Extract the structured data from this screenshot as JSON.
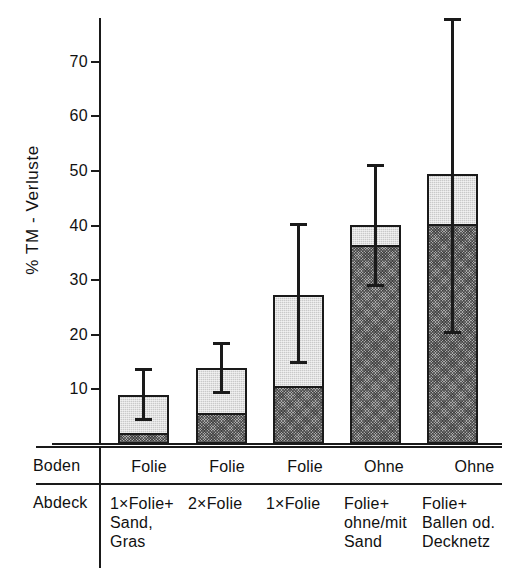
{
  "chart_data": {
    "type": "bar",
    "title": "",
    "xlabel": "",
    "ylabel": "% TM - Verluste",
    "ylim": [
      0,
      78
    ],
    "grid": false,
    "legend": "none",
    "ytick_labels": [
      "70",
      "60",
      "50",
      "40",
      "30",
      "20",
      "10"
    ],
    "ytick_values": [
      70,
      60,
      50,
      40,
      30,
      20,
      10
    ],
    "categories": [
      "Folie / 1×Folie+ Sand, Gras",
      "Folie / 2×Folie",
      "Folie / 1×Folie",
      "Ohne / Folie+ ohne/mit Sand",
      "Ohne / Folie+ Ballen od. Decknetz"
    ],
    "series": [
      {
        "name": "untere Schicht (dunkel schraffiert)",
        "values": [
          2.0,
          5.7,
          10.7,
          36.5,
          40.2
        ]
      },
      {
        "name": "obere Schicht (hell)",
        "values": [
          7.0,
          8.3,
          16.6,
          3.6,
          9.3
        ]
      }
    ],
    "totals": [
      9.0,
      14.0,
      27.3,
      40.1,
      49.5
    ],
    "error_bars": [
      {
        "low": 4.3,
        "high": 14.0
      },
      {
        "low": 9.1,
        "high": 18.7
      },
      {
        "low": 14.6,
        "high": 40.4
      },
      {
        "low": 28.7,
        "high": 51.2
      },
      {
        "low": 20.2,
        "high": 78.0
      }
    ],
    "colors": {
      "upper_segment": "#c9c9c9",
      "lower_segment": "#a8a8a8",
      "outline": "#1a1a1a",
      "error_bar": "#1a1a1a",
      "background": "#ffffff"
    }
  },
  "table": {
    "row_headers": [
      "Boden",
      "Abdeck"
    ],
    "boden": [
      "Folie",
      "Folie",
      "Folie",
      "Ohne",
      "Ohne"
    ],
    "abdeck": [
      "1×Folie+\nSand, Gras",
      "2×Folie",
      "1×Folie",
      "Folie+\nohne/mit\nSand",
      "Folie+\nBallen od.\nDecknetz"
    ]
  }
}
